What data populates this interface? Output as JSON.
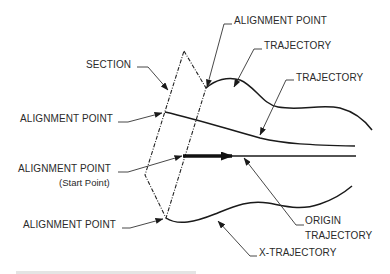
{
  "figure": {
    "labels": {
      "section": "SECTION",
      "alignment_point_top": "ALIGNMENT POINT",
      "trajectory_upper": "TRAJECTORY",
      "trajectory_middle": "TRAJECTORY",
      "alignment_point_left": "ALIGNMENT POINT",
      "alignment_point_start": "ALIGNMENT POINT",
      "alignment_point_start_note": "(Start Point)",
      "alignment_point_bottom": "ALIGNMENT POINT",
      "origin_trajectory_line1": "ORIGIN",
      "origin_trajectory_line2": "TRAJECTORY",
      "x_trajectory": "X-TRAJECTORY"
    },
    "colors": {
      "line": "#1a1a1a",
      "text": "#2a2a2a",
      "background": "#ffffff"
    }
  }
}
